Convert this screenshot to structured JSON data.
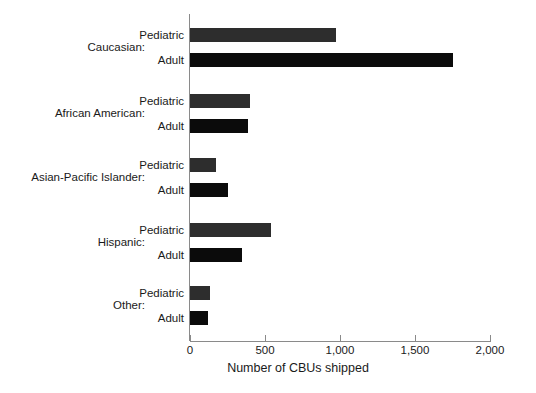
{
  "chart_data": {
    "type": "bar",
    "orientation": "horizontal",
    "title": "",
    "xlabel": "Number of CBUs shipped",
    "ylabel": "",
    "xlim": [
      0,
      2000
    ],
    "xticks": [
      0,
      500,
      1000,
      1500,
      2000
    ],
    "xticklabels": [
      "0",
      "500",
      "1,000",
      "1,500",
      "2,000"
    ],
    "grid": false,
    "legend": "none",
    "categories": [
      "Caucasian:",
      "African American:",
      "Asian-Pacific Islander:",
      "Hispanic:",
      "Other:"
    ],
    "subcategories": [
      "Pediatric",
      "Adult"
    ],
    "series": [
      {
        "name": "Pediatric",
        "color": "#2d2d2d",
        "values": [
          970,
          400,
          173,
          540,
          133
        ]
      },
      {
        "name": "Adult",
        "color": "#0b0b0b",
        "values": [
          1750,
          387,
          253,
          347,
          120
        ]
      }
    ],
    "groups": [
      {
        "label": "Caucasian:",
        "bars": [
          {
            "label": "Pediatric",
            "value": 970,
            "series": "pediatric"
          },
          {
            "label": "Adult",
            "value": 1750,
            "series": "adult"
          }
        ]
      },
      {
        "label": "African American:",
        "bars": [
          {
            "label": "Pediatric",
            "value": 400,
            "series": "pediatric"
          },
          {
            "label": "Adult",
            "value": 387,
            "series": "adult"
          }
        ]
      },
      {
        "label": "Asian-Pacific Islander:",
        "bars": [
          {
            "label": "Pediatric",
            "value": 173,
            "series": "pediatric"
          },
          {
            "label": "Adult",
            "value": 253,
            "series": "adult"
          }
        ]
      },
      {
        "label": "Hispanic:",
        "bars": [
          {
            "label": "Pediatric",
            "value": 540,
            "series": "pediatric"
          },
          {
            "label": "Adult",
            "value": 347,
            "series": "adult"
          }
        ]
      },
      {
        "label": "Other:",
        "bars": [
          {
            "label": "Pediatric",
            "value": 133,
            "series": "pediatric"
          },
          {
            "label": "Adult",
            "value": 120,
            "series": "adult"
          }
        ]
      }
    ]
  },
  "colors": {
    "pediatric": "#2d2d2d",
    "adult": "#0b0b0b",
    "axis": "#8a8a8a",
    "text": "#1a1a1a",
    "background": "#ffffff"
  }
}
